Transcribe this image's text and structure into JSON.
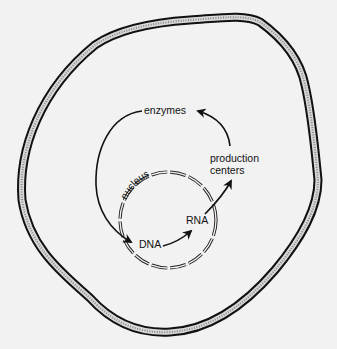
{
  "diagram": {
    "type": "cell-schematic",
    "labels": {
      "enzymes": "enzymes",
      "nucleus": "nucleus",
      "dna": "DNA",
      "rna": "RNA",
      "production_line1": "production",
      "production_line2": "centers"
    },
    "flow": [
      {
        "from": "DNA",
        "to": "RNA"
      },
      {
        "from": "RNA",
        "to": "production centers"
      },
      {
        "from": "production centers",
        "to": "enzymes"
      },
      {
        "from": "enzymes",
        "to": "DNA"
      }
    ],
    "colors": {
      "background": "#f2f2f2",
      "ink": "#111111",
      "membrane_fill": "#bdbdbd"
    }
  }
}
